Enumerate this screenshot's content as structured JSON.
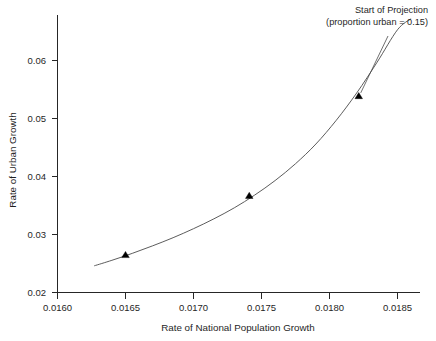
{
  "chart_data": {
    "type": "line",
    "title": "",
    "xlabel": "Rate of National Population Growth",
    "ylabel": "Rate of Urban Growth",
    "xlim": [
      0.01585,
      0.01875
    ],
    "ylim": [
      0.0195,
      0.069
    ],
    "grid": false,
    "legend": null,
    "xticks": [
      0.016,
      0.0165,
      0.017,
      0.0175,
      0.018,
      0.0185
    ],
    "xtick_labels": [
      "0.0160",
      "0.0165",
      "0.0170",
      "0.0175",
      "0.0180",
      "0.0185"
    ],
    "yticks": [
      0.02,
      0.03,
      0.04,
      0.05,
      0.06
    ],
    "ytick_labels": [
      "0.02",
      "0.03",
      "0.04",
      "0.05",
      "0.06"
    ],
    "series": [
      {
        "name": "urban growth curve",
        "color": "#4a4a4a",
        "x": [
          0.01627,
          0.0164,
          0.01655,
          0.0167,
          0.01685,
          0.017,
          0.01715,
          0.0173,
          0.01745,
          0.0176,
          0.01775,
          0.0179,
          0.01805,
          0.0182,
          0.01835,
          0.0185,
          0.0186
        ],
        "y": [
          0.0246,
          0.02555,
          0.02675,
          0.02805,
          0.02945,
          0.031,
          0.0327,
          0.0346,
          0.0368,
          0.0393,
          0.0422,
          0.0456,
          0.0497,
          0.0544,
          0.0597,
          0.0653,
          0.0672
        ]
      }
    ],
    "markers": [
      {
        "x": 0.0165,
        "y": 0.0265,
        "shape": "triangle-up",
        "color": "#000000"
      },
      {
        "x": 0.01741,
        "y": 0.0367,
        "shape": "triangle-up",
        "color": "#000000"
      },
      {
        "x": 0.018215,
        "y": 0.0539,
        "shape": "triangle-up",
        "color": "#000000"
      }
    ],
    "annotations": [
      {
        "name": "start-of-projection",
        "line1": "Start of Projection",
        "line2": "(proportion urban = 0.15)",
        "target_x": 0.018215,
        "target_y": 0.0539
      }
    ]
  },
  "colors": {
    "axis": "#262626",
    "curve": "#4a4a4a",
    "marker": "#000000",
    "text": "#1f1f1f",
    "background": "#ffffff"
  }
}
